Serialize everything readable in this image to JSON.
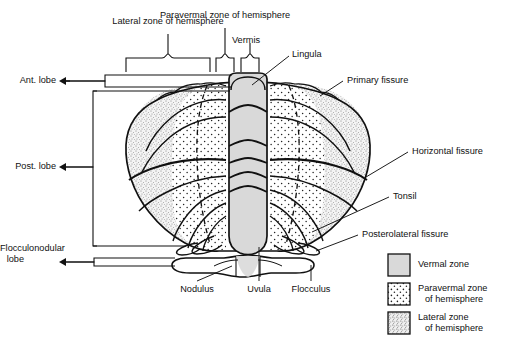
{
  "figure": {
    "type": "anatomical-diagram"
  },
  "top_labels": {
    "lateral_zone": "Lateral zone of hemisphere",
    "paravermal_zone": "Paravermal zone of hemisphere",
    "vermis": "Vermis",
    "lingula": "Lingula"
  },
  "left_labels": {
    "ant_lobe": "Ant. lobe",
    "post_lobe": "Post. lobe",
    "flocculonodular_lobe_l1": "Flocculonodular",
    "flocculonodular_lobe_l2": "lobe"
  },
  "right_labels": {
    "primary_fissure": "Primary fissure",
    "horizontal_fissure": "Horizontal fissure",
    "tonsil": "Tonsil",
    "posterolateral_fissure": "Posterolateral fissure"
  },
  "bottom_labels": {
    "nodulus": "Nodulus",
    "uvula": "Uvula",
    "flocculus": "Flocculus"
  },
  "legend": {
    "items": [
      {
        "label": "Vermal zone",
        "label2": "",
        "pattern": "solid-gray",
        "swatch_color": "#d9d9d9"
      },
      {
        "label": "Paravermal zone",
        "label2": "of hemisphere",
        "pattern": "coarse-dots",
        "swatch_color": "#ffffff"
      },
      {
        "label": "Lateral zone",
        "label2": "of hemisphere",
        "pattern": "fine-stipple",
        "swatch_color": "#efefef"
      }
    ]
  },
  "colors": {
    "ink": "#111111",
    "vermis_fill": "#d9d9d9",
    "paravermal_fill": "#ffffff",
    "lateral_fill": "#f2f2f2",
    "background": "#ffffff"
  }
}
